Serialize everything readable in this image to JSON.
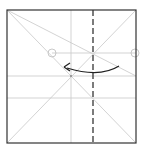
{
  "diagram": {
    "type": "origami-fold-step",
    "colors": {
      "paper_edge": "#333333",
      "crease": "#c8c8c8",
      "valley_fold": "#444444",
      "arrow": "#222222",
      "reference_mark": "#bbbbbb"
    },
    "elements": [
      {
        "kind": "square",
        "label": "paper-square"
      },
      {
        "kind": "crease",
        "label": "diagonal"
      },
      {
        "kind": "crease",
        "label": "anti-diagonal"
      },
      {
        "kind": "crease",
        "label": "vertical-center"
      },
      {
        "kind": "crease",
        "label": "horizontal-center"
      },
      {
        "kind": "crease",
        "label": "horizontal-quarter"
      },
      {
        "kind": "crease",
        "label": "corner-to-edge-line"
      },
      {
        "kind": "valley-fold",
        "label": "dashed-vertical-fold-line"
      },
      {
        "kind": "arrow",
        "label": "fold-direction-arrow-left"
      },
      {
        "kind": "marker",
        "label": "reference-circle-left"
      },
      {
        "kind": "marker",
        "label": "reference-circle-right"
      }
    ]
  }
}
